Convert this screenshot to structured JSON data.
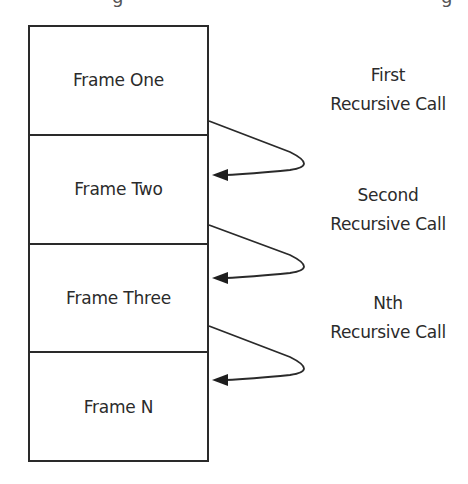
{
  "diagram": {
    "title_partial": "(title cut off above frame)",
    "stack_frames": [
      {
        "label": "Frame One"
      },
      {
        "label": "Frame Two"
      },
      {
        "label": "Frame Three"
      },
      {
        "label": "Frame N"
      }
    ],
    "calls": [
      {
        "line1": "First",
        "line2": "Recursive Call",
        "from": "Frame One",
        "to": "Frame Two"
      },
      {
        "line1": "Second",
        "line2": "Recursive Call",
        "from": "Frame Two",
        "to": "Frame Three"
      },
      {
        "line1": "Nth",
        "line2": "Recursive Call",
        "from": "Frame Three",
        "to": "Frame N"
      }
    ],
    "colors": {
      "stroke": "#2a2a2a",
      "text": "#2b2b2b",
      "background": "#ffffff"
    }
  }
}
